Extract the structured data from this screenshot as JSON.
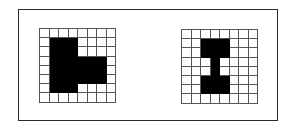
{
  "figure": {
    "colors": {
      "filled": "#000000",
      "empty": "#ffffff",
      "gridline": "#555555",
      "frame": "#2a2a2a"
    },
    "grids": [
      {
        "name": "left-pattern",
        "rows": 8,
        "cols": 8,
        "cells": [
          [
            0,
            0,
            0,
            0,
            0,
            0,
            0,
            0
          ],
          [
            0,
            1,
            1,
            1,
            0,
            0,
            0,
            0
          ],
          [
            0,
            1,
            1,
            1,
            0,
            0,
            0,
            0
          ],
          [
            0,
            1,
            1,
            1,
            1,
            1,
            1,
            0
          ],
          [
            0,
            1,
            1,
            1,
            1,
            1,
            1,
            0
          ],
          [
            0,
            1,
            1,
            1,
            1,
            1,
            1,
            0
          ],
          [
            0,
            1,
            1,
            1,
            0,
            0,
            0,
            0
          ],
          [
            0,
            0,
            0,
            0,
            0,
            0,
            0,
            0
          ]
        ]
      },
      {
        "name": "right-pattern",
        "rows": 8,
        "cols": 8,
        "cells": [
          [
            0,
            0,
            0,
            0,
            0,
            0,
            0,
            0
          ],
          [
            0,
            0,
            1,
            1,
            1,
            0,
            0,
            0
          ],
          [
            0,
            0,
            1,
            1,
            1,
            0,
            0,
            0
          ],
          [
            0,
            0,
            0,
            1,
            0,
            0,
            0,
            0
          ],
          [
            0,
            0,
            0,
            1,
            0,
            0,
            0,
            0
          ],
          [
            0,
            0,
            1,
            1,
            1,
            0,
            0,
            0
          ],
          [
            0,
            0,
            1,
            1,
            1,
            0,
            0,
            0
          ],
          [
            0,
            0,
            0,
            0,
            0,
            0,
            0,
            0
          ]
        ]
      }
    ]
  }
}
